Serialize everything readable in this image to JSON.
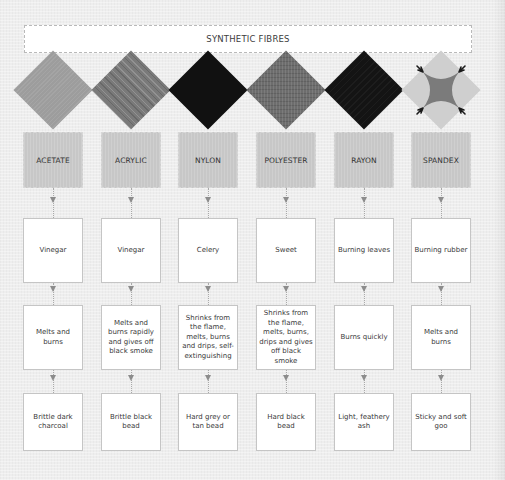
{
  "title": "SYNTHETIC FIBRES",
  "columns": [
    {
      "name": "ACETATE",
      "swatch": {
        "style": "plain",
        "color": "#9d9d9d"
      },
      "smell": "Vinegar",
      "burn": "Melts and burns",
      "residue": "Brittle dark charcoal"
    },
    {
      "name": "ACRYLIC",
      "swatch": {
        "style": "streaked",
        "color": "#7a7a7a"
      },
      "smell": "Vinegar",
      "burn": "Melts and burns rapidly and gives off black smoke",
      "residue": "Brittle black bead"
    },
    {
      "name": "NYLON",
      "swatch": {
        "style": "plain",
        "color": "#111111"
      },
      "smell": "Celery",
      "burn": "Shrinks from the flame, melts, burns and drips, self-extinguishing",
      "residue": "Hard grey or tan bead"
    },
    {
      "name": "POLYESTER",
      "swatch": {
        "style": "heather",
        "color": "#6d6d6d"
      },
      "smell": "Sweet",
      "burn": "Shrinks from the flame, melts, burns, drips and gives off black smoke",
      "residue": "Hard black bead"
    },
    {
      "name": "RAYON",
      "swatch": {
        "style": "plain",
        "color": "#141414"
      },
      "smell": "Burning leaves",
      "burn": "Burns quickly",
      "residue": "Light, feathery ash"
    },
    {
      "name": "SPANDEX",
      "swatch": {
        "style": "stretched",
        "color": "#cfcfcf",
        "center_color": "#7b7b7b",
        "hook_color": "#1a1a1a"
      },
      "smell": "Burning rubber",
      "burn": "Melts and burns",
      "residue": "Sticky and soft goo"
    }
  ],
  "colors": {
    "background": "#eeeeee",
    "fibre_box": "#c7c7c7",
    "info_box": "#ffffff",
    "arrow": "#8c8c8c"
  }
}
